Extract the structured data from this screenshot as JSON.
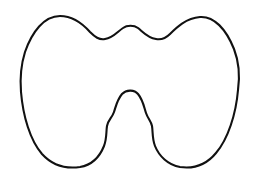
{
  "document": {
    "title": "Thyroid gland outline",
    "background_color": "#ffffff",
    "width": 259,
    "height": 175
  },
  "figure": {
    "name": "thyroid-gland-outline",
    "style": {
      "stroke_color": "#111111",
      "fill_color": "#ffffff",
      "stroke_width": 2.1,
      "closed": true
    },
    "bounds": {
      "left": 20,
      "top": 15,
      "right": 240,
      "bottom": 168
    },
    "landmarks": [
      {
        "name": "left-lobe-apex",
        "x": 60,
        "y": 16
      },
      {
        "name": "left-isthmus-valley",
        "x": 105,
        "y": 39
      },
      {
        "name": "isthmus-superior-bump",
        "x": 130,
        "y": 26
      },
      {
        "name": "right-isthmus-valley",
        "x": 160,
        "y": 39
      },
      {
        "name": "right-lobe-apex",
        "x": 203,
        "y": 17
      },
      {
        "name": "right-lateral-extreme",
        "x": 239,
        "y": 85
      },
      {
        "name": "right-lobe-inferior-pole",
        "x": 180,
        "y": 167
      },
      {
        "name": "right-shoulder-step",
        "x": 152,
        "y": 126
      },
      {
        "name": "pyramidal-lobe-apex",
        "x": 130,
        "y": 90
      },
      {
        "name": "left-shoulder-step",
        "x": 107,
        "y": 126
      },
      {
        "name": "left-lobe-inferior-pole",
        "x": 80,
        "y": 167
      },
      {
        "name": "left-lateral-extreme",
        "x": 21,
        "y": 82
      }
    ],
    "path_d": "M 60 16 C 44 16 32 32 25 52 C 20 68 20 80 21 92 C 23 116 30 140 42 154 C 52 165 66 169 80 167 C 92 165 100 156 104 146 C 107 138 106 132 107 126 C 108 120 112 118 114 112 C 116 106 117 100 122 94 C 126 90 134 89 138 94 C 143 100 144 107 146 113 C 148 119 151 121 152 126 C 153 132 152 138 155 146 C 159 156 168 165 180 167 C 194 169 207 164 216 153 C 228 139 236 114 238 90 C 240 76 239 62 234 49 C 226 29 214 16 200 17 C 186 18 176 28 170 34 C 165 39 161 40 156 39 C 148 38 143 32 138 28 C 134 25 127 25 123 28 C 117 32 113 38 105 39 C 99 40 95 37 90 32 C 82 23 73 16 60 16 Z"
  }
}
